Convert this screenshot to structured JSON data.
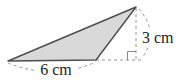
{
  "diagram": {
    "type": "geometry-triangle-figure",
    "shape": "obtuse triangle with altitude shown",
    "labels": {
      "base": "6 cm",
      "height": "3 cm"
    },
    "colors": {
      "background": "#ffffff",
      "triangle_fill": "#d9d9d9",
      "triangle_stroke": "#4d4d4d",
      "dashed_line": "#979797",
      "right_angle_mark": "#8a8a8a",
      "text": "#1c1c1c"
    }
  }
}
